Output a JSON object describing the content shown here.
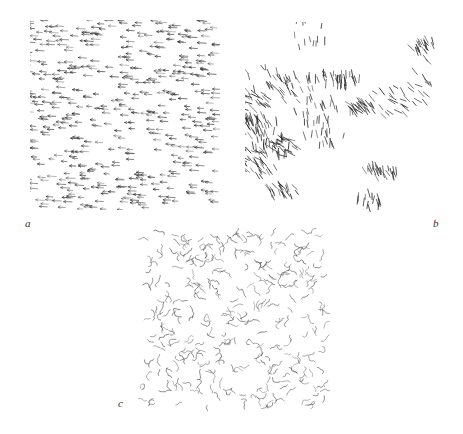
{
  "figure": {
    "background": "#ffffff",
    "ink_color": "#2a2a2a",
    "panels": [
      {
        "id": "a",
        "label": "a",
        "description": "Ordered collective motion: agents aligned, all heading left",
        "box": {
          "x": 30,
          "y": 20,
          "w": 190,
          "h": 190
        },
        "label_pos": {
          "x": 25,
          "y": 218
        },
        "pattern": "aligned",
        "count": 520,
        "heading_deg": 190,
        "heading_spread_deg": 10,
        "seed": 11
      },
      {
        "id": "b",
        "label": "b",
        "description": "Clustered groups: dense locally aligned flocks with gaps",
        "box": {
          "x": 245,
          "y": 22,
          "w": 190,
          "h": 190
        },
        "label_pos": {
          "x": 433,
          "y": 218
        },
        "pattern": "clusters",
        "count": 480,
        "heading_deg": 240,
        "heading_spread_deg": 35,
        "seed": 23
      },
      {
        "id": "c",
        "label": "c",
        "description": "Disordered motion: random wiggling trajectories",
        "box": {
          "x": 138,
          "y": 228,
          "w": 192,
          "h": 183
        },
        "label_pos": {
          "x": 118,
          "y": 398
        },
        "pattern": "random",
        "count": 330,
        "heading_deg": 0,
        "heading_spread_deg": 180,
        "seed": 37
      }
    ]
  }
}
